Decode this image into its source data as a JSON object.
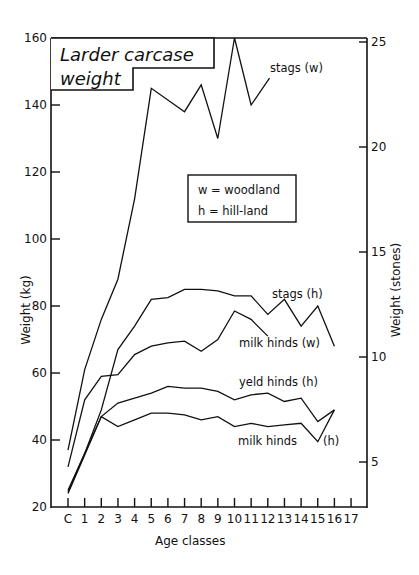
{
  "chart_data": {
    "type": "line",
    "title": "Larder carcase weight",
    "title_lines": [
      "Larder carcase",
      "weight"
    ],
    "xlabel": "Age classes",
    "ylabel": "Weight (kg)",
    "ylabel_right": "Weight (stones)",
    "categories": [
      "C",
      "1",
      "2",
      "3",
      "4",
      "5",
      "6",
      "7",
      "8",
      "9",
      "10",
      "11",
      "12",
      "13",
      "14",
      "15",
      "16",
      "17"
    ],
    "ylim": [
      20,
      160
    ],
    "yticks": [
      20,
      40,
      60,
      80,
      100,
      120,
      140,
      160
    ],
    "ylim_right": [
      3.1,
      25.2
    ],
    "yticks_right": [
      5,
      10,
      15,
      20,
      25
    ],
    "grid": false,
    "legend": {
      "position": "inside-center",
      "entries": [
        "w = woodland",
        "h = hill-land"
      ]
    },
    "series": [
      {
        "name": "stags (w)",
        "values": [
          37,
          61,
          76,
          88,
          112,
          145,
          null,
          138,
          146,
          130,
          160,
          140,
          null,
          null,
          null,
          null,
          null,
          null
        ],
        "label_anchor": [
          12.1,
          148
        ]
      },
      {
        "name": "stags (h)",
        "values": [
          25,
          36,
          49,
          67,
          74,
          82,
          82.5,
          85,
          85,
          84.5,
          83,
          83,
          77.5,
          82,
          74,
          80,
          68,
          null
        ]
      },
      {
        "name": "milk hinds (w)",
        "values": [
          32,
          52,
          59,
          59.5,
          65.5,
          68,
          69,
          69.5,
          66.5,
          70,
          78.5,
          76,
          null,
          null,
          null,
          null,
          null,
          null
        ],
        "label_anchor": [
          12,
          71
        ]
      },
      {
        "name": "yeld hinds (h)",
        "values": [
          24.5,
          36,
          47,
          51,
          52.5,
          54,
          56,
          55.5,
          55.5,
          54.5,
          52,
          53.5,
          54,
          51.5,
          52.5,
          45.5,
          49,
          null
        ]
      },
      {
        "name": "milk hinds (h)",
        "values": [
          24,
          35.5,
          47,
          44,
          46,
          48,
          48,
          47.5,
          46,
          47,
          44,
          45,
          44,
          44.5,
          45,
          39.5,
          49,
          null
        ]
      }
    ]
  },
  "labels": {
    "stags_w": "stags (w)",
    "stags_h": "stags (h)",
    "milk_hinds_w": "milk hinds (w)",
    "yeld_hinds_h": "yeld hinds (h)",
    "milk_hinds_h_text": "milk hinds",
    "milk_hinds_h_suffix": "(h)",
    "legend_w": "w = woodland",
    "legend_h": "h = hill-land",
    "title_line1": "Larder carcase",
    "title_line2": "weight",
    "xlabel": "Age classes",
    "ylabel": "Weight (kg)",
    "ylabel_right": "Weight (stones)"
  }
}
